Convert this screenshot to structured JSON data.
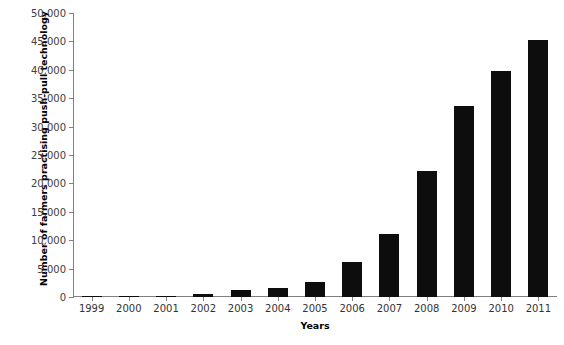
{
  "chart_data": {
    "type": "bar",
    "title": "",
    "xlabel": "Years",
    "ylabel": "Number of farmers practising push-pull technology",
    "categories": [
      "1999",
      "2000",
      "2001",
      "2002",
      "2003",
      "2004",
      "2005",
      "2006",
      "2007",
      "2008",
      "2009",
      "2010",
      "2011"
    ],
    "values": [
      50,
      200,
      250,
      600,
      1200,
      1600,
      2700,
      6200,
      11100,
      22200,
      33700,
      39800,
      45300
    ],
    "series": [
      {
        "name": "Number of farmers practising push-pull technology",
        "values": [
          50,
          200,
          250,
          600,
          1200,
          1600,
          2700,
          6200,
          11100,
          22200,
          33700,
          39800,
          45300
        ]
      }
    ],
    "ylim": [
      0,
      50000
    ],
    "ytick_labels": [
      "0",
      "5,000",
      "10,000",
      "15,000",
      "20,000",
      "25,000",
      "30,000",
      "35,000",
      "40,000",
      "45,000",
      "50,000"
    ],
    "ytick_values": [
      0,
      5000,
      10000,
      15000,
      20000,
      25000,
      30000,
      35000,
      40000,
      45000,
      50000
    ],
    "grid": false,
    "legend": false,
    "legend_position": "none",
    "bar_color": "#0d0d0d",
    "axis_color": "#808080",
    "background": "#ffffff"
  }
}
